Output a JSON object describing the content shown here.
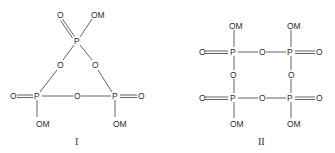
{
  "structures": [
    {
      "label": "I",
      "name": "cyclic trimetaphosphate",
      "atoms": {
        "p_top": "P",
        "o_top_double": "O",
        "om_top": "OM",
        "o_ring_left": "O",
        "o_ring_right": "O",
        "p_left": "P",
        "o_left_double": "O",
        "om_left": "OM",
        "o_ring_bottom": "O",
        "p_right": "P",
        "o_right_double": "O",
        "om_right": "OM"
      }
    },
    {
      "label": "II",
      "name": "cyclic tetrametaphosphate",
      "atoms": {
        "p_tl": "P",
        "om_tl": "OM",
        "o_tl_double": "O",
        "o_ring_top": "O",
        "p_tr": "P",
        "om_tr": "OM",
        "o_tr_double": "O",
        "o_ring_left": "O",
        "o_ring_right": "O",
        "p_bl": "P",
        "om_bl": "OM",
        "o_bl_double": "O",
        "o_ring_bottom": "O",
        "p_br": "P",
        "om_br": "OM",
        "o_br_double": "O"
      }
    }
  ]
}
